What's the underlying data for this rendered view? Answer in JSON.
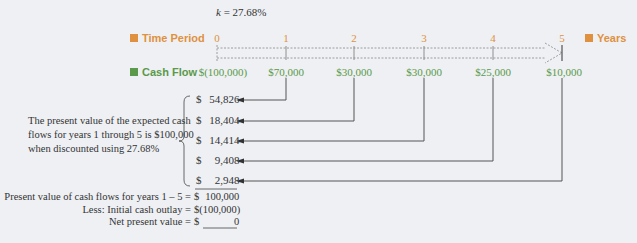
{
  "rate_label": "k = 27.68%",
  "rate": {
    "symbol": "k",
    "value": "= 27.68%"
  },
  "timeline": {
    "time_label": "Time Period",
    "cash_label": "Cash Flow",
    "units_label": "Years",
    "periods": [
      "0",
      "1",
      "2",
      "3",
      "4",
      "5"
    ],
    "cash_flows": [
      "$(100,000)",
      "$70,000",
      "$30,000",
      "$30,000",
      "$25,000",
      "$10,000"
    ],
    "colors": {
      "time": "#e0913f",
      "cash": "#5a9a4a"
    }
  },
  "present_values": [
    {
      "sign": "$",
      "value": "54,826"
    },
    {
      "sign": "$",
      "value": "18,404"
    },
    {
      "sign": "$",
      "value": "14,414"
    },
    {
      "sign": "$",
      "value": "9,408"
    },
    {
      "sign": "$",
      "value": "2,948"
    }
  ],
  "explanation": [
    "The present value of the expected cash",
    "flows for years 1 through 5 is $100,000",
    "when discounted using 27.68%"
  ],
  "summary": [
    {
      "label": "Present value of cash flows for years 1 – 5 =",
      "sign": "$",
      "value": "100,000"
    },
    {
      "label": "Less: Initial cash outlay =",
      "sign": "$",
      "value": "(100,000)"
    },
    {
      "label": "Net present value =",
      "sign": "$",
      "value": "0"
    }
  ]
}
